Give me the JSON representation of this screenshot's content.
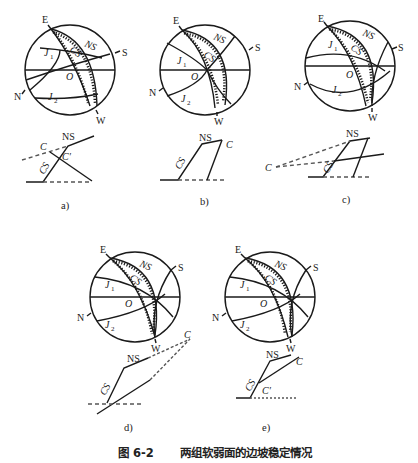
{
  "figure": {
    "caption_number": "图 6-2",
    "caption_title": "两组软弱面的边坡稳定情况"
  },
  "stereonet_labels": {
    "north": "N",
    "south": "S",
    "east": "E",
    "west": "W",
    "center": "O",
    "joint1": "J",
    "joint1_sub": "1",
    "joint2": "J",
    "joint2_sub": "2",
    "natural_slope": "NS",
    "cut_slope": "CS"
  },
  "section_labels": {
    "ns": "NS",
    "cs": "CS",
    "c": "C",
    "c_prime": "C′"
  },
  "panels": [
    {
      "id": "a",
      "label": "a)"
    },
    {
      "id": "b",
      "label": "b)"
    },
    {
      "id": "c",
      "label": "c)"
    },
    {
      "id": "d",
      "label": "d)"
    },
    {
      "id": "e",
      "label": "e)"
    }
  ],
  "colors": {
    "stroke": "#1a1a1a",
    "dashed": "#555555",
    "background": "#ffffff"
  }
}
